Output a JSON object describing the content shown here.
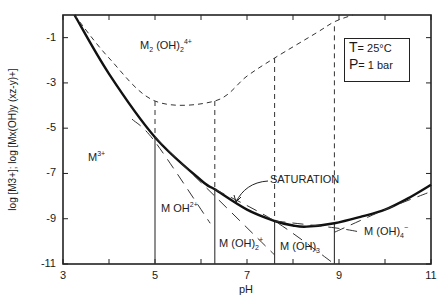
{
  "chart_data": {
    "type": "line",
    "title": "",
    "xlabel": "pH",
    "ylabel": "log [M3+]; log [Mx(OH)y (xz-y)+]",
    "xlim": [
      3,
      11
    ],
    "ylim": [
      -11,
      0
    ],
    "x_ticks": [
      "3",
      "5",
      "7",
      "9",
      "11"
    ],
    "y_ticks": [
      "-1",
      "-3",
      "-5",
      "-7",
      "-9",
      "-11"
    ],
    "grid": false,
    "annotation_box": {
      "line1_symbol": "T",
      "line1_value": "= 25°C",
      "line2_symbol": "P",
      "line2_value": "= 1 bar"
    },
    "region_labels": {
      "m3": "M",
      "m3_sup": "3+",
      "moh": "M OH",
      "moh_sup": "2+",
      "moh2": "M (OH)",
      "moh2_sub": "2",
      "moh2_sup": "+",
      "moh3": "M (OH)",
      "moh3_sub": "3",
      "moh4": "M (OH)",
      "moh4_sub": "4",
      "moh4_sup": "−",
      "dimer": "M",
      "dimer_sub1": "2",
      "dimer_mid": " (OH)",
      "dimer_sub2": "2",
      "dimer_sup": "4+",
      "saturation": "SATURATION"
    },
    "series": [
      {
        "name": "saturation",
        "style": "solid-bold",
        "x": [
          3.25,
          4.0,
          5.0,
          6.0,
          6.3,
          7.0,
          7.6,
          8.0,
          8.3,
          8.9,
          9.5,
          10.0,
          10.5,
          11.0
        ],
        "y": [
          0.0,
          -2.6,
          -5.4,
          -7.3,
          -7.7,
          -8.6,
          -9.1,
          -9.3,
          -9.35,
          -9.2,
          -8.9,
          -8.6,
          -8.1,
          -7.5
        ]
      },
      {
        "name": "M2(OH)2 4+ boundary",
        "style": "dashed",
        "x": [
          3.25,
          4.0,
          5.0,
          6.3,
          7.0,
          7.6,
          8.5,
          8.9,
          9.3
        ],
        "y": [
          0.0,
          -1.9,
          -3.8,
          -3.8,
          -2.7,
          -1.9,
          -0.8,
          -0.3,
          0.0
        ]
      },
      {
        "name": "M3+ line",
        "style": "long-dash",
        "x": [
          4.5,
          5.0,
          6.2
        ],
        "y": [
          -4.6,
          -5.6,
          -9.2
        ]
      },
      {
        "name": "MOH2+ line",
        "style": "long-dash",
        "x": [
          5.0,
          6.3,
          7.6
        ],
        "y": [
          -5.4,
          -8.0,
          -10.6
        ]
      },
      {
        "name": "M(OH)2+ line",
        "style": "long-dash",
        "x": [
          6.3,
          7.6,
          8.9
        ],
        "y": [
          -7.7,
          -9.1,
          -11.0
        ]
      },
      {
        "name": "M(OH)3 line",
        "style": "long-dash",
        "x": [
          7.6,
          8.9,
          9.5
        ],
        "y": [
          -9.1,
          -9.4,
          -9.6
        ]
      },
      {
        "name": "M(OH)4- line",
        "style": "long-dash",
        "x": [
          8.9,
          10.0,
          11.0
        ],
        "y": [
          -9.6,
          -8.6,
          -7.8
        ]
      }
    ],
    "boundaries_pH": [
      5.0,
      6.3,
      7.6,
      8.9
    ]
  }
}
